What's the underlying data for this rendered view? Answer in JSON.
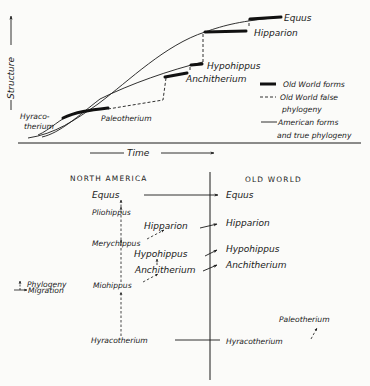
{
  "top_diagram": {
    "y_axis_label": "Structure",
    "x_axis_label": "Time",
    "labels": {
      "equus": "Equus",
      "hipparion": "Hipparion",
      "hypohippus": "Hypohippus",
      "anchitherium": "Anchitherium",
      "hyracotherium_line1": "Hyraco-",
      "hyracotherium_line2": "therium",
      "paleotherium": "Paleotherium"
    },
    "legend": {
      "old_world_forms": "Old World forms",
      "false_phylogeny_line1": "Old World false",
      "false_phylogeny_line2": "phylogeny",
      "american_line1": "American forms",
      "american_line2": "and true phylogeny"
    }
  },
  "bottom_diagram": {
    "header_left": "NORTH AMERICA",
    "header_right": "OLD WORLD",
    "north_america": {
      "equus": "Equus",
      "pliohippus": "Pliohippus",
      "hipparion": "Hipparion",
      "merychippus": "Merychippus",
      "hypohippus": "Hypohippus",
      "anchitherium": "Anchitherium",
      "miohippus": "Miohippus",
      "hyracotherium": "Hyracotherium"
    },
    "old_world": {
      "equus": "Equus",
      "hipparion": "Hipparion",
      "hypohippus": "Hypohippus",
      "anchitherium": "Anchitherium",
      "hyracotherium": "Hyracotherium",
      "paleotherium": "Paleotherium"
    },
    "key": {
      "phylogeny": "Phylogeny",
      "migration": "Migration"
    }
  },
  "colors": {
    "ink": "#1a1a1a",
    "paper": "#fbfbf9"
  }
}
